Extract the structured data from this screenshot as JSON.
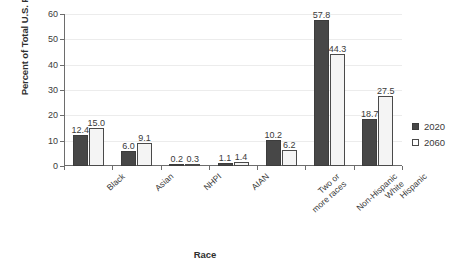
{
  "chart_data": {
    "type": "bar",
    "title": "",
    "xlabel": "Race",
    "ylabel": "Percent of Total U.S. Population",
    "ylim": [
      0,
      60
    ],
    "yticks": [
      0,
      10,
      20,
      30,
      40,
      50,
      60
    ],
    "grid": true,
    "legend_position": "right",
    "categories": [
      "Black",
      "Asian",
      "NHPI",
      "AIAN",
      "Two or\nmore races",
      "Non-Hispanic\nWhite",
      "Hispanic"
    ],
    "series": [
      {
        "name": "2020",
        "color": "#474747",
        "values": [
          12.4,
          6.0,
          0.2,
          1.1,
          10.2,
          57.8,
          18.7
        ],
        "labels": [
          "12.4",
          "6.0",
          "0.2",
          "1.1",
          "10.2",
          "57.8",
          "18.7"
        ]
      },
      {
        "name": "2060",
        "color": "#f4f4f4",
        "values": [
          15.0,
          9.1,
          0.3,
          1.4,
          6.2,
          44.3,
          27.5
        ],
        "labels": [
          "15.0",
          "9.1",
          "0.3",
          "1.4",
          "6.2",
          "44.3",
          "27.5"
        ]
      }
    ]
  },
  "legend": {
    "items": [
      {
        "label": "2020",
        "swatch": "filled-square-icon"
      },
      {
        "label": "2060",
        "swatch": "hollow-square-icon"
      }
    ]
  }
}
